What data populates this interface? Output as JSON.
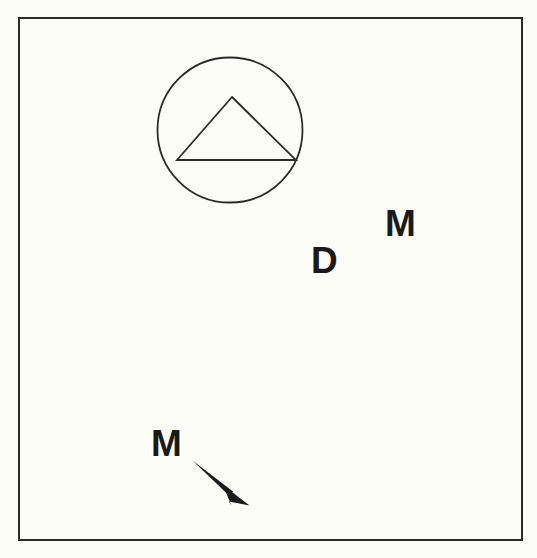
{
  "figure": {
    "kind": "line-drawing-diagram",
    "background_color": "#fdfdf8",
    "ink_color": "#1a1a1a",
    "width": 537,
    "height": 558,
    "frame": {
      "name": "outer-border",
      "x": 19,
      "y": 18,
      "width": 503,
      "height": 522,
      "stroke_color": "#2a2a28",
      "stroke_width": 2,
      "fill": "none"
    },
    "shapes": [
      {
        "id": "circle-symbol",
        "type": "circle",
        "cx": 230,
        "cy": 130,
        "r": 72.5,
        "stroke_color": "#2a2a28",
        "stroke_width": 1.8,
        "fill": "none"
      },
      {
        "id": "triangle-symbol",
        "type": "triangle",
        "points": "232,97 296,160 177,160",
        "stroke_color": "#2a2a28",
        "stroke_width": 1.8,
        "fill": "none"
      }
    ],
    "labels": [
      {
        "id": "label-m-upper-right",
        "text": "M",
        "x": 385,
        "y": 236,
        "font_size": 37
      },
      {
        "id": "label-d",
        "text": "D",
        "x": 311,
        "y": 273,
        "font_size": 37
      },
      {
        "id": "label-m-lower-left",
        "text": "M",
        "x": 151,
        "y": 456,
        "font_size": 37
      }
    ],
    "annotations": [
      {
        "id": "leader-arrow",
        "type": "tapered-arrow",
        "from_x": 192,
        "from_y": 461,
        "to_x": 248,
        "to_y": 504,
        "shaft_path": "M 192 461 L 231 490 L 228 494 Z",
        "head_path": "M 222 487 L 249 505 L 231 500 L 232 503 Z",
        "fill_color": "#1a1a1a",
        "points_to": "down-right"
      }
    ]
  }
}
